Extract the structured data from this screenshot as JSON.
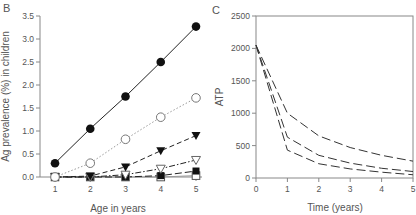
{
  "chart_data": [
    {
      "panel": "B",
      "type": "line",
      "xlabel": "Age in years",
      "ylabel": "Ag prevalence (%) in children",
      "xlim": [
        0.6,
        5.1
      ],
      "ylim": [
        0,
        3.5
      ],
      "x_ticks": [
        1,
        2,
        3,
        4,
        5
      ],
      "y_ticks": [
        "0.0",
        "0.5",
        "1.0",
        "1.5",
        "2.0",
        "2.5",
        "3.0",
        "3.5"
      ],
      "grid": false,
      "x": [
        1,
        2,
        3,
        4,
        5
      ],
      "series": [
        {
          "name": "filled-circle-solid",
          "marker": "filled-circle",
          "line": "solid",
          "values": [
            0.3,
            1.05,
            1.75,
            2.5,
            3.27
          ]
        },
        {
          "name": "open-circle-dotted",
          "marker": "open-circle",
          "line": "dotted",
          "values": [
            0.0,
            0.3,
            0.82,
            1.3,
            1.72
          ]
        },
        {
          "name": "filled-triangle-dashed",
          "marker": "filled-triangle-down",
          "line": "dashed",
          "values": [
            0.0,
            0.02,
            0.22,
            0.57,
            0.9
          ]
        },
        {
          "name": "open-triangle-dashdot",
          "marker": "open-triangle-down",
          "line": "dashdot",
          "values": [
            0.0,
            0.0,
            0.05,
            0.18,
            0.37
          ]
        },
        {
          "name": "filled-square-dashed",
          "marker": "filled-square",
          "line": "longdash",
          "values": [
            0.0,
            0.0,
            0.0,
            0.03,
            0.13
          ]
        },
        {
          "name": "open-square-solid",
          "marker": "open-square",
          "line": "solid-gray",
          "values": [
            0.0,
            0.0,
            0.0,
            0.0,
            0.03
          ]
        }
      ]
    },
    {
      "panel": "C",
      "type": "line",
      "xlabel": "Time (years)",
      "ylabel": "ATP",
      "xlim": [
        0,
        5
      ],
      "ylim": [
        0,
        2500
      ],
      "x_ticks": [
        0,
        1,
        2,
        3,
        4,
        5
      ],
      "y_ticks": [
        "0",
        "500",
        "1000",
        "1500",
        "2000",
        "2500"
      ],
      "grid": false,
      "x": [
        0,
        1,
        2,
        3,
        4,
        5
      ],
      "series": [
        {
          "name": "upper",
          "line": "dashed",
          "values": [
            2050,
            1000,
            650,
            470,
            350,
            260
          ]
        },
        {
          "name": "middle",
          "line": "dashed",
          "values": [
            2050,
            630,
            350,
            230,
            150,
            100
          ]
        },
        {
          "name": "lower",
          "line": "dashed",
          "values": [
            2050,
            430,
            220,
            140,
            90,
            50
          ]
        }
      ]
    }
  ],
  "panels": {
    "b_label": "B",
    "c_label": "C"
  }
}
